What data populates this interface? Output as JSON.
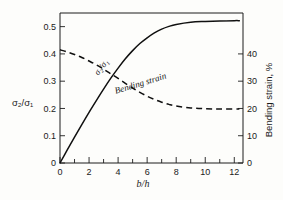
{
  "chart_data": {
    "type": "line",
    "title": "",
    "xlabel": "b/h",
    "ylabel": "σ₂/σ₁",
    "y2label": "Bending strain, %",
    "xlim": [
      0,
      12.6
    ],
    "ylim": [
      0,
      0.55
    ],
    "y2lim": [
      0,
      55
    ],
    "grid": false,
    "legend_position": "inline-curve-labels",
    "x_ticks": [
      0,
      1,
      2,
      3,
      4,
      5,
      6,
      7,
      8,
      9,
      10,
      11,
      12
    ],
    "x_tick_labels": [
      "0",
      "",
      "2",
      "",
      "4",
      "",
      "6",
      "",
      "8",
      "",
      "10",
      "",
      "12"
    ],
    "y_ticks": [
      0,
      0.1,
      0.2,
      0.3,
      0.4,
      0.5
    ],
    "y_tick_labels": [
      "0",
      "0.1",
      "0.2",
      "0.3",
      "0.4",
      "0.5"
    ],
    "y2_ticks": [
      0,
      10,
      20,
      30,
      40
    ],
    "y2_tick_labels": [
      "0",
      "10",
      "20",
      "30",
      "40"
    ],
    "series": [
      {
        "name": "σ₂/σ₁",
        "axis": "left",
        "style": "solid",
        "label_text": "σ₂/σ₁",
        "x": [
          0,
          0.5,
          1,
          1.5,
          2,
          2.5,
          3,
          3.5,
          4,
          4.5,
          5,
          5.5,
          6,
          6.5,
          7,
          7.5,
          8,
          9,
          10,
          11,
          12,
          12.35
        ],
        "values": [
          0,
          0.048,
          0.095,
          0.141,
          0.186,
          0.229,
          0.271,
          0.311,
          0.348,
          0.382,
          0.412,
          0.438,
          0.459,
          0.477,
          0.491,
          0.501,
          0.508,
          0.516,
          0.519,
          0.521,
          0.522,
          0.522
        ]
      },
      {
        "name": "Bending strain",
        "axis": "right",
        "style": "dashed",
        "label_text": "Bending strain",
        "x": [
          0,
          0.5,
          1,
          1.5,
          2,
          2.5,
          3,
          3.5,
          4,
          4.5,
          5,
          5.5,
          6,
          6.5,
          7,
          7.5,
          8,
          9,
          10,
          11,
          12,
          12.35
        ],
        "values": [
          41.5,
          40.7,
          39.8,
          38.7,
          37.4,
          36.0,
          34.4,
          32.7,
          31.0,
          29.2,
          27.5,
          25.9,
          24.5,
          23.3,
          22.3,
          21.5,
          20.9,
          20.2,
          19.9,
          19.8,
          19.8,
          19.8
        ]
      }
    ],
    "annotations": [
      {
        "text": "σ₂/σ₁",
        "x": 3.0,
        "y": 0.345,
        "rotation": -52
      },
      {
        "text": "Bending strain",
        "x": 5.6,
        "y": 0.282,
        "rotation": -17
      }
    ]
  },
  "axes": {
    "left_title": "σ₂/σ₁",
    "right_title": "Bending strain, %",
    "bottom_title": "b/h"
  }
}
